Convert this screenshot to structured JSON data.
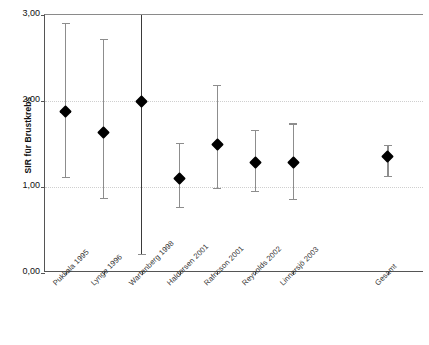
{
  "chart_data": {
    "type": "scatter",
    "title": "",
    "xlabel": "",
    "ylabel": "SIR für Brustkrebs",
    "ylim": [
      0.0,
      3.0
    ],
    "yticks": [
      0.0,
      1.0,
      2.0,
      3.0
    ],
    "ytick_labels": [
      "0,00",
      "1,00",
      "2,00",
      "3,00"
    ],
    "grid": true,
    "legend": "none",
    "error_bars": "95% confidence interval",
    "categories": [
      "Pukkala 1995",
      "Lynge 1996",
      "Wartenberg 1998",
      "Haldorsen 2001",
      "Rafnsson 2001",
      "Reynolds 2002",
      "Linnersjö 2003",
      "Gesamt"
    ],
    "series": [
      {
        "name": "SIR für Brustkrebs",
        "values": [
          1.88,
          1.63,
          2.0,
          1.1,
          1.5,
          1.29,
          1.29,
          1.35
        ],
        "ci_low": [
          1.12,
          0.87,
          0.22,
          0.77,
          0.99,
          0.95,
          0.86,
          1.13
        ],
        "ci_high": [
          2.91,
          2.72,
          3.3,
          1.51,
          2.19,
          1.66,
          1.74,
          1.49
        ],
        "ci_high_clipped": [
          false,
          false,
          true,
          false,
          false,
          false,
          false,
          false
        ]
      }
    ],
    "points": [
      {
        "label": "Pukkala 1995",
        "value": 1.88,
        "low": 1.12,
        "high": 2.91,
        "high_clipped": false
      },
      {
        "label": "Lynge 1996",
        "value": 1.63,
        "low": 0.87,
        "high": 2.72,
        "high_clipped": false
      },
      {
        "label": "Wartenberg 1998",
        "value": 2.0,
        "low": 0.22,
        "high": 3.3,
        "high_clipped": true
      },
      {
        "label": "Haldorsen 2001",
        "value": 1.1,
        "low": 0.77,
        "high": 1.51,
        "high_clipped": false
      },
      {
        "label": "Rafnsson 2001",
        "value": 1.5,
        "low": 0.99,
        "high": 2.19,
        "high_clipped": false
      },
      {
        "label": "Reynolds 2002",
        "value": 1.29,
        "low": 0.95,
        "high": 1.66,
        "high_clipped": false
      },
      {
        "label": "Linnersjö 2003",
        "value": 1.29,
        "low": 0.86,
        "high": 1.74,
        "high_clipped": false
      },
      {
        "label": "Gesamt",
        "value": 1.35,
        "low": 1.13,
        "high": 1.49,
        "high_clipped": false
      }
    ],
    "colors": {
      "marker": "#000000",
      "errorbar": "#8d8d8d",
      "axis": "#555555",
      "grid": "#cfcfcf",
      "background": "#ffffff"
    }
  }
}
